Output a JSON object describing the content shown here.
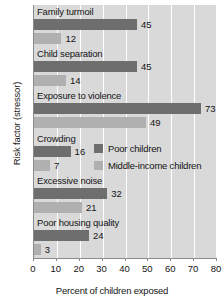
{
  "chart_data": {
    "type": "bar",
    "orientation": "horizontal",
    "title": "",
    "xlabel": "Percent of children exposed",
    "ylabel": "Risk factor (stressor)",
    "xlim": [
      0,
      80
    ],
    "xticks": [
      0,
      10,
      20,
      30,
      40,
      50,
      60,
      70,
      80
    ],
    "grid": "vertical-white-gridlines",
    "legend_position": "inside-right",
    "categories": [
      "Family turmoil",
      "Child separation",
      "Exposure to violence",
      "Crowding",
      "Excessive noise",
      "Poor housing quality"
    ],
    "series": [
      {
        "name": "Poor children",
        "color": "#6e6e6e",
        "values": [
          45,
          45,
          73,
          16,
          32,
          24
        ]
      },
      {
        "name": "Middle-income children",
        "color": "#b0b0b0",
        "values": [
          12,
          14,
          49,
          7,
          21,
          3
        ]
      }
    ]
  },
  "legend": {
    "items": [
      {
        "label": "Poor children"
      },
      {
        "label": "Middle-income children"
      }
    ]
  },
  "colors": {
    "poor": "#6e6e6e",
    "middle": "#b0b0b0",
    "plot_background": "#d9d9d9",
    "gridline": "#ffffff",
    "axis": "#8a8a8a"
  }
}
